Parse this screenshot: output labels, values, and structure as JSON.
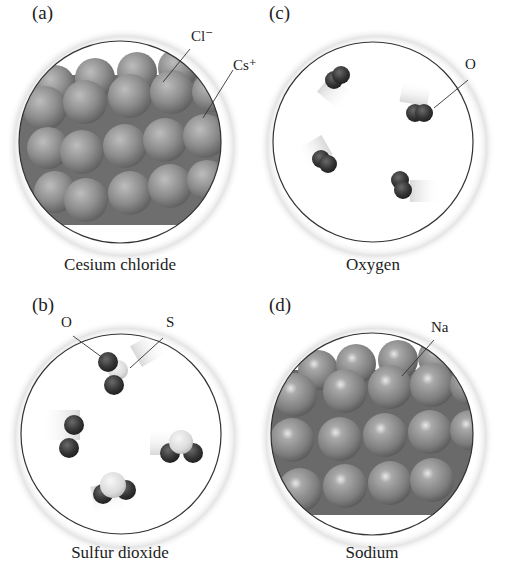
{
  "panels": [
    {
      "id": "a",
      "letter": "(a)",
      "caption": "Cesium chloride",
      "labels": [
        "Cl⁻",
        "Cs⁺"
      ]
    },
    {
      "id": "b",
      "letter": "(b)",
      "caption": "Sulfur dioxide",
      "labels": [
        "O",
        "S"
      ]
    },
    {
      "id": "c",
      "letter": "(c)",
      "caption": "Oxygen",
      "labels": [
        "O"
      ]
    },
    {
      "id": "d",
      "letter": "(d)",
      "caption": "Sodium",
      "labels": [
        "Na"
      ]
    }
  ],
  "colors": {
    "sphere_gray": "#8a8a8a",
    "dark_atom": "#2e2e2e",
    "light_atom": "#dcdcdc",
    "outline": "#333333"
  }
}
